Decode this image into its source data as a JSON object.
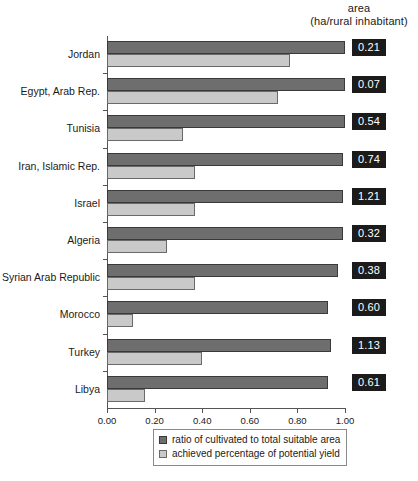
{
  "header": {
    "line1": "area",
    "line2": "(ha/rural inhabitant)"
  },
  "legend": {
    "series1_label": "ratio of cultivated to total suitable area",
    "series2_label": "achieved percentage of potential yield"
  },
  "colors": {
    "series1": "#6e6e6e",
    "series2": "#c9c9c9",
    "chip_background": "#1b1b1b",
    "chip_text": "#ffffff",
    "axis": "#555555"
  },
  "chart_data": {
    "type": "bar",
    "orientation": "horizontal",
    "title": "",
    "subtitle": "",
    "xlabel": "",
    "ylabel": "",
    "xlim": [
      0.0,
      1.0
    ],
    "grid": false,
    "legend_position": "bottom",
    "tick_labels": [
      "0.00",
      "0.20",
      "0.40",
      "0.60",
      "0.80",
      "1.00"
    ],
    "tick_values": [
      0.0,
      0.2,
      0.4,
      0.6,
      0.8,
      1.0
    ],
    "categories": [
      "Jordan",
      "Egypt, Arab Rep.",
      "Tunisia",
      "Iran, Islamic Rep.",
      "Israel",
      "Algeria",
      "Syrian Arab Republic",
      "Morocco",
      "Turkey",
      "Libya"
    ],
    "series": [
      {
        "name": "ratio of cultivated to total suitable area",
        "color": "#6e6e6e",
        "values": [
          1.0,
          1.0,
          1.0,
          0.99,
          0.99,
          0.99,
          0.97,
          0.93,
          0.94,
          0.93
        ]
      },
      {
        "name": "achieved percentage of potential yield",
        "color": "#c9c9c9",
        "values": [
          0.77,
          0.72,
          0.32,
          0.37,
          0.37,
          0.25,
          0.37,
          0.11,
          0.4,
          0.16
        ]
      }
    ],
    "annotations": {
      "label": "area (ha/rural inhabitant)",
      "values": [
        "0.21",
        "0.07",
        "0.54",
        "0.74",
        "1.21",
        "0.32",
        "0.38",
        "0.60",
        "1.13",
        "0.61"
      ]
    }
  }
}
